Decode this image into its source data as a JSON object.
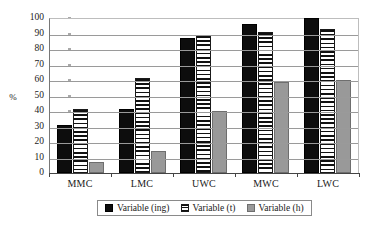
{
  "chart_data": {
    "type": "bar",
    "title": "",
    "xlabel": "",
    "ylabel": "%",
    "ylim": [
      0,
      100
    ],
    "yticks": [
      0,
      10,
      20,
      30,
      40,
      50,
      60,
      70,
      80,
      90,
      100
    ],
    "grid": true,
    "legend_position": "bottom",
    "categories": [
      "MMC",
      "LMC",
      "UWC",
      "MWC",
      "LWC"
    ],
    "series": [
      {
        "name": "Variable (ing)",
        "color": "#0d0d0d",
        "pattern": "solid",
        "values": [
          31,
          41,
          87,
          96,
          100
        ]
      },
      {
        "name": "Variable (t)",
        "color": "#ffffff",
        "pattern": "horizontal-stripes",
        "values": [
          41,
          61,
          89,
          91,
          93
        ]
      },
      {
        "name": "Variable (h)",
        "color": "#999999",
        "pattern": "solid-gray",
        "values": [
          7,
          14,
          40,
          59,
          60
        ]
      }
    ]
  },
  "axis": {
    "y_title": "%",
    "y_tick_labels": [
      "100",
      "90",
      "80",
      "70",
      "60",
      "50",
      "40",
      "30",
      "20",
      "10",
      "0"
    ],
    "x_tick_labels": [
      "MMC",
      "LMC",
      "UWC",
      "MWC",
      "LWC"
    ]
  },
  "legend": {
    "items": [
      {
        "label": "Variable (ing)"
      },
      {
        "label": "Variable (t)"
      },
      {
        "label": "Variable (h)"
      }
    ]
  }
}
